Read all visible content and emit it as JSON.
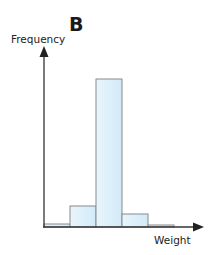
{
  "chart_data": {
    "type": "bar",
    "title": "B",
    "xlabel": "Weight",
    "ylabel": "Frequency",
    "categories": [
      "bin1",
      "bin2",
      "bin3",
      "bin4",
      "bin5"
    ],
    "values": [
      3,
      21,
      148,
      13,
      2
    ],
    "ylim": [
      0,
      180
    ],
    "grid": false,
    "legend": null
  },
  "style": {
    "bar_fill": "#dff0fa",
    "bar_stroke": "#8a8a8a",
    "axis_color": "#333333"
  }
}
